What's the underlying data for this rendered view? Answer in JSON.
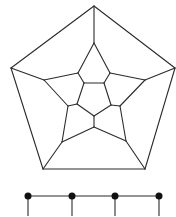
{
  "figure": {
    "title": "",
    "colors": {
      "edge": "#2b2b2b",
      "node": "#111111",
      "background": "#ffffff"
    }
  },
  "dodecahedron": {
    "vertices": {
      "o0": [
        94,
        6
      ],
      "o1": [
        175,
        68
      ],
      "o2": [
        145,
        169
      ],
      "o3": [
        43,
        169
      ],
      "o4": [
        11,
        68
      ],
      "s0": [
        94,
        43
      ],
      "s1": [
        145,
        80
      ],
      "s2": [
        126,
        141
      ],
      "s3": [
        62,
        142
      ],
      "s4": [
        44,
        80
      ],
      "m0": [
        110,
        73
      ],
      "m1": [
        120,
        106
      ],
      "m2": [
        94,
        127
      ],
      "m3": [
        68,
        106
      ],
      "m4": [
        78,
        73
      ],
      "i0": [
        84,
        83
      ],
      "i1": [
        104,
        83
      ],
      "i2": [
        111,
        105
      ],
      "i3": [
        94,
        116
      ],
      "i4": [
        77,
        104
      ]
    },
    "edges": [
      [
        "o0",
        "o1"
      ],
      [
        "o1",
        "o2"
      ],
      [
        "o2",
        "o3"
      ],
      [
        "o3",
        "o4"
      ],
      [
        "o4",
        "o0"
      ],
      [
        "o0",
        "s0"
      ],
      [
        "o1",
        "s1"
      ],
      [
        "o2",
        "s2"
      ],
      [
        "o3",
        "s3"
      ],
      [
        "o4",
        "s4"
      ],
      [
        "s0",
        "m0"
      ],
      [
        "m0",
        "s1"
      ],
      [
        "s1",
        "m1"
      ],
      [
        "m1",
        "s2"
      ],
      [
        "s2",
        "m2"
      ],
      [
        "m2",
        "s3"
      ],
      [
        "s3",
        "m3"
      ],
      [
        "m3",
        "s4"
      ],
      [
        "s4",
        "m4"
      ],
      [
        "m4",
        "s0"
      ],
      [
        "m4",
        "i0"
      ],
      [
        "m0",
        "i1"
      ],
      [
        "m1",
        "i2"
      ],
      [
        "m2",
        "i3"
      ],
      [
        "m3",
        "i4"
      ],
      [
        "i0",
        "i1"
      ],
      [
        "i1",
        "i2"
      ],
      [
        "i2",
        "i3"
      ],
      [
        "i3",
        "i4"
      ],
      [
        "i4",
        "i0"
      ]
    ]
  },
  "path_graph": {
    "nodes": [
      [
        28,
        196
      ],
      [
        72,
        196
      ],
      [
        115,
        196
      ],
      [
        159,
        196
      ]
    ],
    "node_radius": 3.5,
    "drop_to_y": 216
  }
}
